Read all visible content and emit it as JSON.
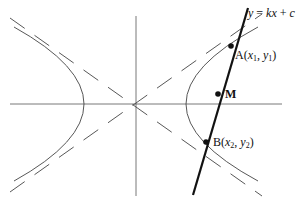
{
  "diagram": {
    "line_label": "y = kx + c",
    "points": [
      {
        "name": "A",
        "label": "A(x₁, y₁)"
      },
      {
        "name": "M",
        "label": "M"
      },
      {
        "name": "B",
        "label": "B(x₂, y₂)"
      }
    ],
    "elements": [
      "x-axis",
      "y-axis",
      "hyperbola left branch",
      "hyperbola right branch",
      "asymptotes (dashed)",
      "secant line"
    ]
  },
  "labels": {
    "line_eq": "y = kx + c",
    "A": "A(x",
    "A_sub1": "1",
    "A_mid": ", y",
    "A_sub2": "1",
    "A_end": ")",
    "M": "M",
    "B": "B(x",
    "B_sub1": "2",
    "B_mid": ", y",
    "B_sub2": "2",
    "B_end": ")"
  },
  "colors": {
    "stroke": "#333333",
    "line": "#111111",
    "background": "#ffffff"
  }
}
